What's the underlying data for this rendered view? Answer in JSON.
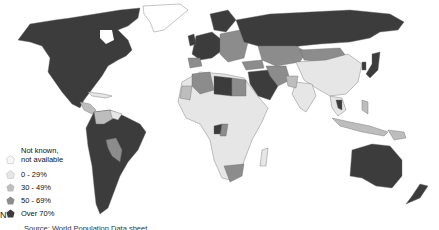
{
  "map": {
    "title": "",
    "colors": {
      "not_known": "#f7f7f7",
      "0_29": "#e6e6e6",
      "30_49": "#bdbdbd",
      "50_69": "#8c8c8c",
      "over_70": "#3c3c3c",
      "border": "#6a6a6a"
    }
  },
  "legend": {
    "items": [
      {
        "label_line1": "Not known,",
        "label_line2": "not available",
        "color": "#f7f7f7"
      },
      {
        "label": "0 - 29%",
        "color": "#e6e6e6"
      },
      {
        "label": "30 - 49%",
        "color": "#bdbdbd"
      },
      {
        "label": "50 - 69%",
        "color": "#8c8c8c"
      },
      {
        "label": "Over 70%",
        "color": "#3c3c3c"
      }
    ]
  },
  "north_arrow": "N",
  "source": "Source: World Population Data sheet"
}
